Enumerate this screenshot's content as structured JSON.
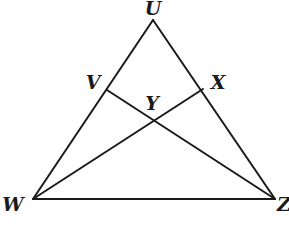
{
  "diagram": {
    "type": "triangle-with-cevians",
    "points": {
      "U": {
        "x": 153,
        "y": 20,
        "label": "U",
        "label_x": 153,
        "label_y": 8
      },
      "V": {
        "x": 107,
        "y": 90,
        "label": "V",
        "label_x": 93,
        "label_y": 82
      },
      "X": {
        "x": 203,
        "y": 89,
        "label": "X",
        "label_x": 218,
        "label_y": 82
      },
      "Y": {
        "x": 150,
        "y": 122,
        "label": "Y",
        "label_x": 152,
        "label_y": 103
      },
      "W": {
        "x": 33,
        "y": 199,
        "label": "W",
        "label_x": 13,
        "label_y": 204
      },
      "Z": {
        "x": 275,
        "y": 199,
        "label": "Z",
        "label_x": 284,
        "label_y": 204
      }
    },
    "segments": [
      {
        "from": "U",
        "to": "W"
      },
      {
        "from": "U",
        "to": "Z"
      },
      {
        "from": "W",
        "to": "Z"
      },
      {
        "from": "W",
        "to": "X"
      },
      {
        "from": "Z",
        "to": "V"
      }
    ],
    "colors": {
      "stroke": "#1a1a1a",
      "background": "#ffffff"
    }
  }
}
